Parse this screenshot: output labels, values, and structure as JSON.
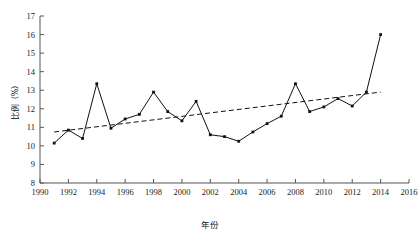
{
  "chart_data": {
    "type": "line",
    "title": "",
    "xlabel": "年份",
    "ylabel": "比例（%）",
    "xlim": [
      1990,
      2016
    ],
    "ylim": [
      8,
      17
    ],
    "grid": false,
    "legend_position": "none",
    "x_ticks": [
      1990,
      1992,
      1994,
      1996,
      1998,
      2000,
      2002,
      2004,
      2006,
      2008,
      2010,
      2012,
      2014,
      2016
    ],
    "y_ticks": [
      8,
      9,
      10,
      11,
      12,
      13,
      14,
      15,
      16,
      17
    ],
    "series": [
      {
        "name": "比例",
        "style": "solid-with-markers",
        "x": [
          1991,
          1992,
          1993,
          1994,
          1995,
          1996,
          1997,
          1998,
          1999,
          2000,
          2001,
          2002,
          2003,
          2004,
          2005,
          2006,
          2007,
          2008,
          2009,
          2010,
          2011,
          2012,
          2013,
          2014
        ],
        "values": [
          10.15,
          10.85,
          10.4,
          13.35,
          10.95,
          11.45,
          11.7,
          12.9,
          11.85,
          11.35,
          12.4,
          10.6,
          10.5,
          10.25,
          10.75,
          11.2,
          11.6,
          13.35,
          11.85,
          12.1,
          12.55,
          12.15,
          12.9,
          16.0
        ]
      },
      {
        "name": "线性趋势",
        "style": "dashed",
        "x": [
          1991,
          2014
        ],
        "values": [
          10.75,
          12.9
        ]
      }
    ]
  },
  "caption": {
    "text": ""
  }
}
